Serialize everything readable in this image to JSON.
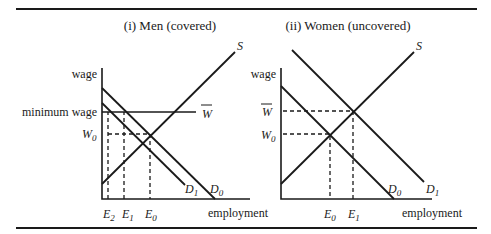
{
  "figure": {
    "panels": [
      {
        "title": "(i) Men (covered)",
        "y_axis_label": "wage",
        "x_axis_label": "employment",
        "wage_labels": {
          "minimum_wage": "minimum wage",
          "w_bar": "W",
          "w0": "W",
          "w0_sub": "0"
        },
        "curve_labels": {
          "supply": "S",
          "d0": "D",
          "d0_sub": "0",
          "d1": "D",
          "d1_sub": "1"
        },
        "employment_labels": [
          {
            "main": "E",
            "sub": "2"
          },
          {
            "main": "E",
            "sub": "1"
          },
          {
            "main": "E",
            "sub": "0"
          }
        ]
      },
      {
        "title": "(ii) Women (uncovered)",
        "y_axis_label": "wage",
        "x_axis_label": "employment",
        "wage_labels": {
          "w_bar": "W",
          "w0": "W",
          "w0_sub": "0"
        },
        "curve_labels": {
          "supply": "S",
          "d0": "D",
          "d0_sub": "0",
          "d1": "D",
          "d1_sub": "1"
        },
        "employment_labels": [
          {
            "main": "E",
            "sub": "0"
          },
          {
            "main": "E",
            "sub": "1"
          }
        ]
      }
    ]
  }
}
